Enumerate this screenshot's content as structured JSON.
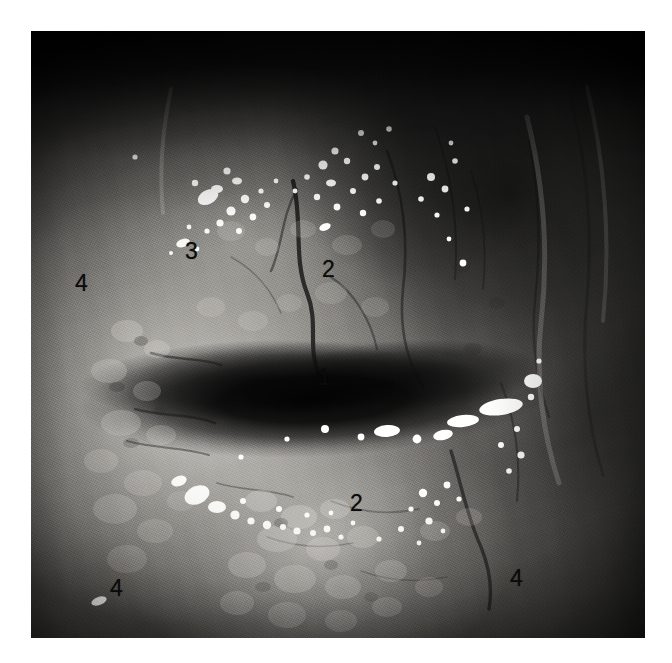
{
  "page": {
    "background_color": "#ffffff",
    "width": 672,
    "height": 663
  },
  "figure": {
    "type": "clinical-endoscopic-photograph",
    "color_mode": "grayscale",
    "frame": {
      "left": 31,
      "top": 31,
      "width": 614,
      "height": 607
    },
    "tone": {
      "darkest": "#0a0a0a",
      "mid": "#8a8882",
      "lightest": "#f2f1ee",
      "vignette": "#141414"
    }
  },
  "annotations": [
    {
      "id": "label-3",
      "text": "3",
      "x": 185,
      "y": 240
    },
    {
      "id": "label-2-upper",
      "text": "2",
      "x": 322,
      "y": 258
    },
    {
      "id": "label-4-left",
      "text": "4",
      "x": 75,
      "y": 272
    },
    {
      "id": "label-1",
      "text": "1",
      "x": 318,
      "y": 366
    },
    {
      "id": "label-2-lower",
      "text": "2",
      "x": 350,
      "y": 492
    },
    {
      "id": "label-4-bottom-left",
      "text": "4",
      "x": 110,
      "y": 577
    },
    {
      "id": "label-4-bottom-right",
      "text": "4",
      "x": 510,
      "y": 567
    }
  ]
}
